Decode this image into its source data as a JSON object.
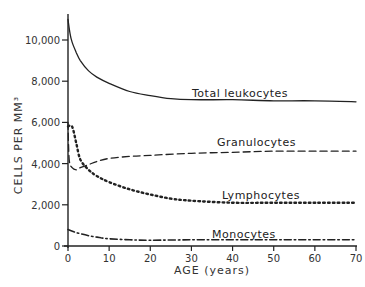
{
  "chart_data": {
    "type": "line",
    "title": "",
    "xlabel": "AGE (years)",
    "ylabel": "CELLS PER MM³",
    "xlim": [
      0,
      70
    ],
    "ylim": [
      0,
      11000
    ],
    "xticks": [
      0,
      10,
      20,
      30,
      40,
      50,
      60,
      70
    ],
    "xtick_labels": [
      "0",
      "10",
      "20",
      "30",
      "40",
      "50",
      "60",
      "70"
    ],
    "yticks": [
      0,
      2000,
      4000,
      6000,
      8000,
      10000
    ],
    "ytick_labels": [
      "0",
      "2,000",
      "4,000",
      "6,000",
      "8,000",
      "10,000"
    ],
    "grid": false,
    "legend": "inline labels above each curve",
    "series": [
      {
        "name": "Total leukocytes",
        "style": "solid",
        "x": [
          0,
          0.5,
          1,
          2,
          3,
          5,
          7,
          10,
          15,
          20,
          25,
          30,
          40,
          50,
          60,
          70
        ],
        "values": [
          11000,
          10300,
          9900,
          9400,
          9000,
          8500,
          8200,
          7900,
          7500,
          7300,
          7150,
          7100,
          7100,
          7050,
          7050,
          7000
        ]
      },
      {
        "name": "Granulocytes",
        "style": "dashed",
        "x": [
          0,
          0.3,
          1,
          2,
          3,
          5,
          7,
          10,
          15,
          20,
          30,
          40,
          50,
          60,
          70
        ],
        "values": [
          6000,
          4200,
          3800,
          3700,
          3800,
          3950,
          4100,
          4250,
          4350,
          4400,
          4500,
          4550,
          4600,
          4600,
          4600
        ]
      },
      {
        "name": "Lymphocytes",
        "style": "dotted",
        "x": [
          0,
          1,
          2,
          3,
          5,
          7,
          10,
          15,
          20,
          25,
          30,
          40,
          50,
          60,
          70
        ],
        "values": [
          5800,
          5800,
          5000,
          4200,
          3700,
          3400,
          3100,
          2750,
          2500,
          2300,
          2200,
          2100,
          2100,
          2100,
          2100
        ]
      },
      {
        "name": "Monocytes",
        "style": "dash-dot",
        "x": [
          0,
          2,
          5,
          8,
          10,
          15,
          20,
          30,
          40,
          50,
          60,
          70
        ],
        "values": [
          800,
          650,
          500,
          400,
          350,
          300,
          280,
          300,
          300,
          300,
          300,
          300
        ]
      }
    ],
    "series_labels": [
      "Total leukocytes",
      "Granulocytes",
      "Lymphocytes",
      "Monocytes"
    ]
  }
}
